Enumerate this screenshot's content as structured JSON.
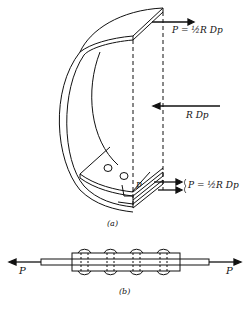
{
  "figure_a": {
    "caption": "(a)",
    "top_force_label": "P = ½R Dp",
    "middle_force_label": "R Dp",
    "pitch_label": "p",
    "bottom_force_label": "P = ½R Dp"
  },
  "figure_b": {
    "caption": "(b)",
    "left_force_label": "P",
    "right_force_label": "P",
    "rivet_count": 4
  },
  "colors": {
    "stroke": "#111111",
    "background": "#ffffff"
  }
}
